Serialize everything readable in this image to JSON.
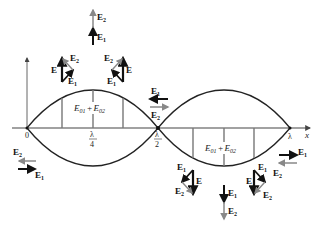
{
  "diagram": {
    "axis": {
      "x_label": "x",
      "origin_label": "0",
      "ticks": [
        {
          "label_num": "λ",
          "label_den": "4",
          "x": 93
        },
        {
          "label_num": "λ",
          "label_den": "2",
          "x": 158
        },
        {
          "label": "λ",
          "x": 290
        }
      ]
    },
    "envelope_labels": [
      {
        "text_a": "E",
        "sub_a": "01",
        "plus": "+",
        "text_b": "E",
        "sub_b": "02"
      },
      {
        "text_a": "E",
        "sub_a": "01",
        "plus": "+",
        "text_b": "E",
        "sub_b": "02"
      }
    ],
    "vectors": {
      "E1": "E",
      "E1_sub": "1",
      "E2": "E",
      "E2_sub": "2",
      "E": "E"
    },
    "colors": {
      "curve": "#222222",
      "e1_arrow": "#111111",
      "e2_arrow": "#888888",
      "grid_lines": "#777777"
    }
  }
}
